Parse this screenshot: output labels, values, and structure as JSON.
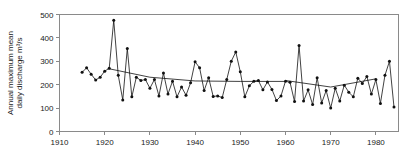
{
  "chart_data": {
    "type": "line",
    "title": "",
    "xlabel": "",
    "ylabel": "Annual maximum mean daily discharge m³/s",
    "ylabel_lines": [
      "Annual maximum mean",
      "daily discharge m³/s"
    ],
    "xlim": [
      1910,
      1985
    ],
    "ylim": [
      0,
      500
    ],
    "xticks": [
      1910,
      1920,
      1930,
      1940,
      1950,
      1960,
      1970,
      1980
    ],
    "xticklabels": [
      "1910",
      "1920",
      "1930",
      "1940",
      "1950",
      "1960",
      "1970",
      "1980"
    ],
    "yticks": [
      0,
      100,
      200,
      300,
      400,
      500
    ],
    "yticklabels": [
      "0",
      "100",
      "200",
      "300",
      "400",
      "500"
    ],
    "grid": false,
    "legend": null,
    "marker": "filled-circle",
    "line_color": "#111111",
    "frame_color": "#8a8a8a",
    "series": [
      {
        "name": "Annual maximum mean daily discharge",
        "x": [
          1915,
          1916,
          1917,
          1918,
          1919,
          1920,
          1921,
          1922,
          1923,
          1924,
          1925,
          1926,
          1927,
          1928,
          1929,
          1930,
          1931,
          1932,
          1933,
          1934,
          1935,
          1936,
          1937,
          1938,
          1939,
          1940,
          1941,
          1942,
          1943,
          1944,
          1945,
          1946,
          1947,
          1948,
          1949,
          1950,
          1951,
          1952,
          1953,
          1954,
          1955,
          1956,
          1957,
          1958,
          1959,
          1960,
          1961,
          1962,
          1963,
          1964,
          1965,
          1966,
          1967,
          1968,
          1969,
          1970,
          1971,
          1972,
          1973,
          1974,
          1975,
          1976,
          1977,
          1978,
          1979,
          1980,
          1981,
          1982,
          1983,
          1984
        ],
        "y": [
          253,
          272,
          245,
          220,
          232,
          258,
          270,
          475,
          240,
          135,
          355,
          148,
          232,
          218,
          222,
          185,
          222,
          152,
          250,
          160,
          215,
          148,
          190,
          155,
          208,
          298,
          272,
          175,
          230,
          150,
          152,
          145,
          222,
          300,
          340,
          255,
          148,
          195,
          215,
          218,
          178,
          212,
          180,
          132,
          152,
          215,
          210,
          128,
          368,
          130,
          178,
          115,
          230,
          122,
          175,
          100,
          185,
          130,
          198,
          168,
          148,
          228,
          205,
          235,
          160,
          222,
          120,
          240,
          300,
          105
        ]
      }
    ],
    "trend_segments": [
      {
        "name": "fitted-trend-early",
        "x": [
          1921,
          1930,
          1940,
          1950,
          1960
        ],
        "y": [
          268,
          232,
          216,
          214,
          214
        ]
      },
      {
        "name": "fitted-trend-late",
        "x": [
          1960,
          1970,
          1980
        ],
        "y": [
          218,
          190,
          225
        ]
      }
    ]
  },
  "figure": {
    "background": "#ffffff",
    "width": 416,
    "height": 158
  }
}
